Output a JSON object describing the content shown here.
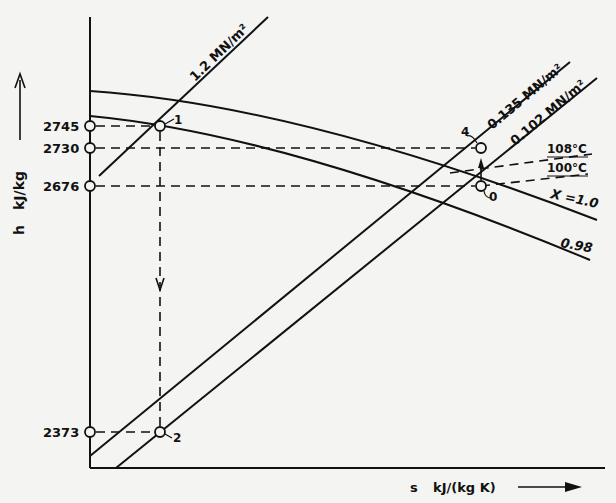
{
  "diagram": {
    "type": "h-s (Mollier) chart, throttling calorimeter process",
    "axes": {
      "y_symbol": "h",
      "y_unit": "kJ/kg",
      "x_symbol": "s",
      "x_unit": "kJ/(kg K)"
    },
    "y_ticks": [
      {
        "value": "2745",
        "y": 126
      },
      {
        "value": "2730",
        "y": 148
      },
      {
        "value": "2676",
        "y": 186
      },
      {
        "value": "2373",
        "y": 432
      }
    ],
    "isobars": [
      {
        "label": "1.2 MN/m²"
      },
      {
        "label": "0.135 MN/m²"
      },
      {
        "label": "0.102 MN/m²"
      }
    ],
    "isotherms": [
      {
        "label": "108°C"
      },
      {
        "label": "100°C"
      }
    ],
    "quality_lines": [
      {
        "label": "X =1.0"
      },
      {
        "label": "0.98"
      }
    ],
    "points": [
      {
        "label": "1"
      },
      {
        "label": "2"
      },
      {
        "label": "4"
      },
      {
        "label": "0"
      }
    ]
  }
}
